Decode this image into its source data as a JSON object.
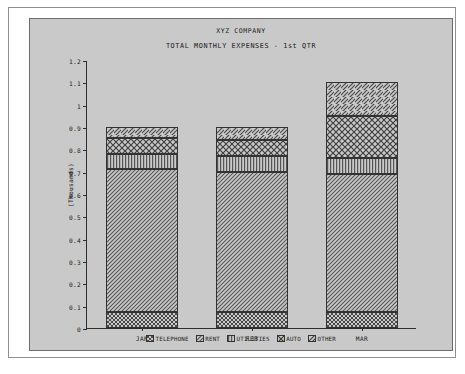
{
  "chart_data": {
    "type": "bar",
    "subtype": "stacked",
    "title": "XYZ COMPANY",
    "subtitle": "TOTAL MONTHLY EXPENSES - 1st QTR",
    "xlabel": "",
    "ylabel": "(Thousands)",
    "categories": [
      "JAN",
      "FEB",
      "MAR"
    ],
    "ylim": [
      0,
      1.2
    ],
    "yticks": [
      "0",
      "0.1",
      "0.2",
      "0.3",
      "0.4",
      "0.5",
      "0.6",
      "0.7",
      "0.8",
      "0.9",
      "1",
      "1.1",
      "1.2"
    ],
    "ytick_values": [
      0,
      0.1,
      0.2,
      0.3,
      0.4,
      0.5,
      0.6,
      0.7,
      0.8,
      0.9,
      1.0,
      1.1,
      1.2
    ],
    "grid": false,
    "legend_position": "bottom",
    "series": [
      {
        "name": "TELEPHONE",
        "pattern": "checker-dense",
        "values": [
          0.07,
          0.07,
          0.07
        ]
      },
      {
        "name": "RENT",
        "pattern": "diagonal-fine",
        "values": [
          0.64,
          0.63,
          0.62
        ]
      },
      {
        "name": "UTILITIES",
        "pattern": "vertical-lines",
        "values": [
          0.07,
          0.07,
          0.07
        ]
      },
      {
        "name": "AUTO",
        "pattern": "cross-hatch",
        "values": [
          0.07,
          0.07,
          0.19
        ]
      },
      {
        "name": "OTHER",
        "pattern": "diagonal-wide",
        "values": [
          0.05,
          0.06,
          0.15
        ]
      }
    ],
    "totals": [
      0.9,
      0.9,
      1.1
    ],
    "stack_boundaries": {
      "JAN": [
        0.07,
        0.71,
        0.78,
        0.85,
        0.9
      ],
      "FEB": [
        0.07,
        0.7,
        0.77,
        0.84,
        0.9
      ],
      "MAR": [
        0.07,
        0.69,
        0.76,
        0.95,
        1.1
      ]
    }
  },
  "colors": {
    "card_background": "#c9c9c9",
    "page_background": "#ffffff",
    "axis": "#2e2e2e",
    "frame": "#8e8e8e",
    "text": "#1b1b1b"
  }
}
